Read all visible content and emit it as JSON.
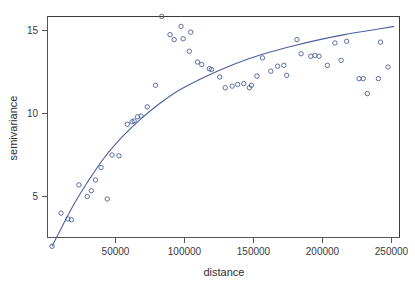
{
  "chart_data": {
    "type": "scatter",
    "title": "",
    "xlabel": "distance",
    "ylabel": "semivariance",
    "xlim": [
      0,
      257000
    ],
    "ylim": [
      0.8,
      16.8
    ],
    "grid": false,
    "legend": "none",
    "point_color": "#4d5f9c",
    "curve_color": "#4d5f9c",
    "frame_color": "#3b3b3b",
    "background": "#ffffff",
    "xticks": [
      50000,
      100000,
      150000,
      200000,
      250000
    ],
    "xtick_labels": [
      "50000",
      "100000",
      "150000",
      "200000",
      "250000"
    ],
    "yticks": [
      5,
      10,
      15
    ],
    "ytick_labels": [
      "5",
      "10",
      "15"
    ],
    "series": [
      {
        "name": "empirical semivariance",
        "marker": "open-circle",
        "x": [
          4000,
          10500,
          15500,
          18000,
          23500,
          29500,
          32500,
          35500,
          39500,
          44000,
          47500,
          52500,
          58500,
          62000,
          63500,
          66000,
          68500,
          73000,
          79000,
          83500,
          89500,
          92500,
          97500,
          99000,
          103500,
          104500,
          109500,
          112500,
          118000,
          119500,
          125500,
          129500,
          134500,
          138500,
          143000,
          147000,
          148500,
          152500,
          156500,
          162500,
          167500,
          172000,
          174000,
          181500,
          184500,
          191500,
          194500,
          197500,
          203500,
          209000,
          213500,
          217500,
          226500,
          229500,
          232500,
          240500,
          242000,
          247500
        ],
        "y": [
          2.0,
          4.0,
          3.65,
          3.6,
          5.7,
          5.0,
          5.35,
          6.0,
          6.75,
          4.85,
          7.5,
          7.45,
          9.35,
          9.5,
          9.55,
          9.8,
          9.85,
          10.4,
          11.7,
          15.85,
          14.75,
          14.45,
          15.25,
          14.5,
          13.75,
          14.9,
          13.1,
          12.95,
          12.7,
          12.65,
          12.2,
          11.55,
          11.65,
          11.75,
          11.8,
          11.55,
          11.7,
          12.25,
          13.35,
          12.55,
          12.85,
          12.9,
          12.3,
          14.45,
          13.6,
          13.45,
          13.5,
          13.45,
          12.9,
          14.25,
          13.2,
          14.35,
          12.1,
          12.1,
          11.2,
          12.1,
          14.3,
          12.8
        ]
      }
    ],
    "fitted_model": {
      "name": "exponential variogram model",
      "nugget": 1.4,
      "sill": 15.6,
      "range": 95000,
      "x": [
        4000,
        12000,
        20000,
        30000,
        42000,
        55000,
        68000,
        82000,
        96000,
        112000,
        128000,
        145000,
        162000,
        180000,
        198000,
        216000,
        234000,
        252000
      ],
      "y": [
        2.0,
        3.3,
        4.55,
        5.9,
        7.35,
        8.6,
        9.65,
        10.6,
        11.4,
        12.1,
        12.7,
        13.25,
        13.7,
        14.1,
        14.45,
        14.75,
        15.0,
        15.25
      ]
    }
  },
  "axes": {
    "x_title": "distance",
    "y_title": "semivariance"
  }
}
